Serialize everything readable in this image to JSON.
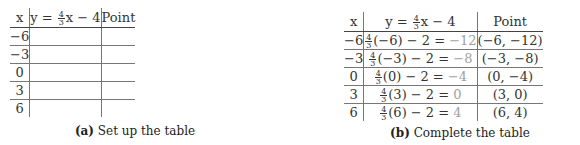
{
  "equation": {
    "lhs": "y",
    "frac_num": "4",
    "frac_den": "3",
    "rest": "x − 4"
  },
  "headers": {
    "x": "x",
    "point": "Point"
  },
  "table_a": {
    "caption_label": "(a)",
    "caption_text": " Set up the table",
    "rows": [
      {
        "x": "−6",
        "y_expr": "",
        "point": ""
      },
      {
        "x": "−3",
        "y_expr": "",
        "point": ""
      },
      {
        "x": "0",
        "y_expr": "",
        "point": ""
      },
      {
        "x": "3",
        "y_expr": "",
        "point": ""
      },
      {
        "x": "6",
        "y_expr": "",
        "point": ""
      }
    ]
  },
  "table_b": {
    "caption_label": "(b)",
    "caption_text": " Complete the table",
    "rows": [
      {
        "x": "−6",
        "frac_num": "4",
        "frac_den": "3",
        "expr": "(−6) − 2 = ",
        "result": "−12",
        "point": "(−6, −12)"
      },
      {
        "x": "−3",
        "frac_num": "4",
        "frac_den": "3",
        "expr": "(−3) − 2 = ",
        "result": "−8",
        "point": "(−3, −8)"
      },
      {
        "x": "0",
        "frac_num": "4",
        "frac_den": "3",
        "expr": "(0) − 2 = ",
        "result": "−4",
        "point": "(0, −4)"
      },
      {
        "x": "3",
        "frac_num": "4",
        "frac_den": "3",
        "expr": "(3) − 2 = ",
        "result": "0",
        "point": "(3, 0)"
      },
      {
        "x": "6",
        "frac_num": "4",
        "frac_den": "3",
        "expr": "(6) − 2 = ",
        "result": "4",
        "point": "(6, 4)"
      }
    ]
  },
  "colors": {
    "text": "#333333",
    "result_gray": "#a0a0a0",
    "rule": "#777777"
  }
}
